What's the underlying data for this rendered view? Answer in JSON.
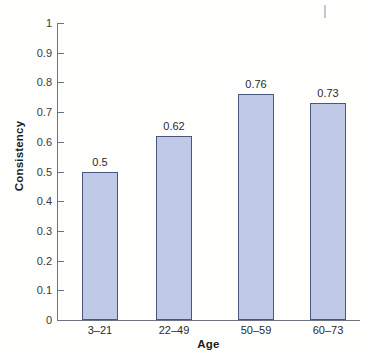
{
  "chart_data": {
    "type": "bar",
    "title": "",
    "subtitle": "",
    "xlabel": "Age",
    "ylabel": "Consistency",
    "categories": [
      "3–21",
      "22–49",
      "50–59",
      "60–73"
    ],
    "values": [
      0.5,
      0.62,
      0.76,
      0.73
    ],
    "value_labels": [
      "0.5",
      "0.62",
      "0.76",
      "0.73"
    ],
    "ylim": [
      0,
      1
    ],
    "ytick_labels": [
      "0",
      "0.1",
      "0.2",
      "0.3",
      "0.4",
      "0.5",
      "0.6",
      "0.7",
      "0.8",
      "0.9",
      "1"
    ],
    "ytick_values": [
      0,
      0.1,
      0.2,
      0.3,
      0.4,
      0.5,
      0.6,
      0.7,
      0.8,
      0.9,
      1
    ],
    "grid": false,
    "legend": null,
    "legend_position": "none",
    "annotations": [],
    "colors": {
      "bar_fill": "#c0cae6",
      "bar_border": "#4a5580",
      "axis": "#6d7382",
      "text": "#2b2b2b",
      "axis_title": "#1c1c1c",
      "background": "#fefefd"
    }
  }
}
